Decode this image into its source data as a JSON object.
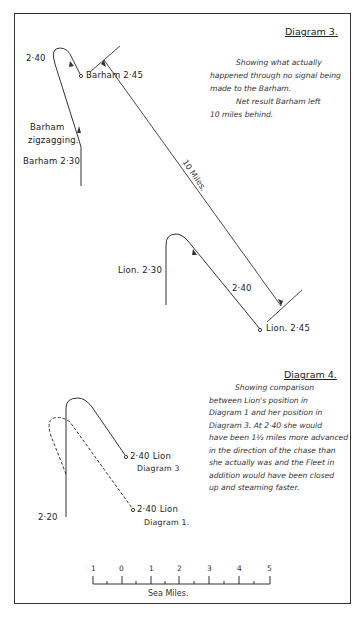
{
  "diagram3": {
    "title": "Diagram 3.",
    "description_line1": "Showing what actually",
    "description_line2": "happened through no signal being",
    "description_line3": "made to the Barham.",
    "description_line4": "Net result Barham left",
    "description_line5": "10 miles behind.",
    "labels": {
      "barham_240": "2·40",
      "barham_245": "Barham 2·45",
      "barham_zigzag_1": "Barham",
      "barham_zigzag_2": "zigzagging.",
      "barham_230": "Barham 2·30",
      "ten_miles": "10 Miles.",
      "lion_230": "Lion. 2·30",
      "lion_240": "2·40",
      "lion_245": "Lion. 2·45"
    }
  },
  "diagram4": {
    "title": "Diagram 4.",
    "lines": [
      "Showing comparison",
      "between Lion's position in",
      "Diagram 1 and her position in",
      "Diagram 3.  At 2·40 she would",
      "have been 1½ miles more advanced",
      "in the direction of the chase than",
      "she actually was and the Fleet in",
      "addition would have been closed",
      "up and steaming faster."
    ],
    "labels": {
      "start_220": "2·20",
      "lion_d3_time": "2·40 Lion",
      "lion_d3_ref": "Diagram 3",
      "lion_d1_time": "2·40 Lion",
      "lion_d1_ref": "Diagram 1."
    }
  },
  "scale": {
    "ticks": [
      "1",
      "0",
      "1",
      "2",
      "3",
      "4",
      "5"
    ],
    "caption": "Sea Miles."
  }
}
